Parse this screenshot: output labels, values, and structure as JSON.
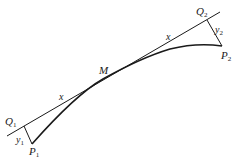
{
  "diagram": {
    "colors": {
      "stroke": "#1a1a1a",
      "background": "#ffffff"
    },
    "labels": {
      "Q1": {
        "main": "Q",
        "sub": "1"
      },
      "Q2": {
        "main": "Q",
        "sub": "2"
      },
      "P1": {
        "main": "P",
        "sub": "1"
      },
      "P2": {
        "main": "P",
        "sub": "2"
      },
      "y1": {
        "main": "y",
        "sub": "1"
      },
      "y2": {
        "main": "y",
        "sub": "2"
      },
      "M": "M",
      "x_left": "x",
      "x_right": "x"
    }
  }
}
